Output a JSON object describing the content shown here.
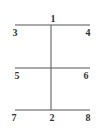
{
  "diagram": {
    "lines": {
      "color": "#555555",
      "vertical": {
        "x": 51,
        "y1": 25,
        "y2": 110
      },
      "horizontals": [
        {
          "y": 25,
          "x1": 15,
          "x2": 90
        },
        {
          "y": 68,
          "x1": 15,
          "x2": 90
        },
        {
          "y": 110,
          "x1": 15,
          "x2": 90
        }
      ]
    },
    "labels": {
      "n1": "1",
      "n2": "2",
      "n3": "3",
      "n4": "4",
      "n5": "5",
      "n6": "6",
      "n7": "7",
      "n8": "8"
    }
  }
}
